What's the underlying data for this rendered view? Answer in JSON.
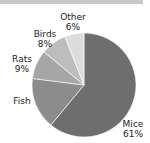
{
  "chart_data": {
    "type": "pie",
    "title": "",
    "categories": [
      "Mice",
      "Fish",
      "Rats",
      "Birds",
      "Other"
    ],
    "values": [
      61,
      16,
      9,
      8,
      6
    ],
    "labels": [
      "Mice\n61%",
      "Fish",
      "Rats\n9%",
      "Birds\n8%",
      "Other\n6%"
    ],
    "colors": [
      "#6e6e6e",
      "#8c8c8c",
      "#a6a6a6",
      "#bdbdbd",
      "#dcdcdc"
    ],
    "start_angle": "12 o'clock",
    "direction": "clockwise"
  },
  "labels": {
    "mice_name": "Mice",
    "mice_pct": "61%",
    "fish_name": "Fish",
    "rats_name": "Rats",
    "rats_pct": "9%",
    "birds_name": "Birds",
    "birds_pct": "8%",
    "other_name": "Other",
    "other_pct": "6%"
  }
}
